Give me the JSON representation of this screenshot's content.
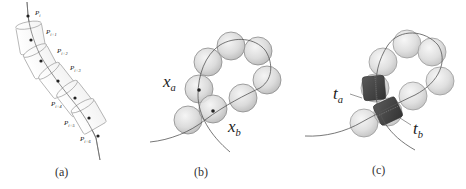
{
  "figure": {
    "panels": [
      {
        "id": "a",
        "caption": "(a)",
        "labels": [
          {
            "base": "P",
            "sub": "i"
          },
          {
            "base": "P",
            "sub": "i+1"
          },
          {
            "base": "P",
            "sub": "i+2"
          },
          {
            "base": "P",
            "sub": "i+3"
          },
          {
            "base": "P",
            "sub": "i+4"
          },
          {
            "base": "P",
            "sub": "i+5"
          },
          {
            "base": "P",
            "sub": "i+6"
          }
        ]
      },
      {
        "id": "b",
        "caption": "(b)",
        "labels": [
          {
            "base": "x",
            "sub": "a"
          },
          {
            "base": "x",
            "sub": "b"
          }
        ]
      },
      {
        "id": "c",
        "caption": "(c)",
        "labels": [
          {
            "base": "t",
            "sub": "a"
          },
          {
            "base": "t",
            "sub": "b"
          }
        ]
      }
    ]
  },
  "colors": {
    "sphere_fill": "#d6d6d6",
    "sphere_stroke": "#8a8a8a",
    "curve": "#555555",
    "cylinder_stroke": "#9a9a9a",
    "box_fill": "#4a4a4a",
    "point": "#222222"
  }
}
